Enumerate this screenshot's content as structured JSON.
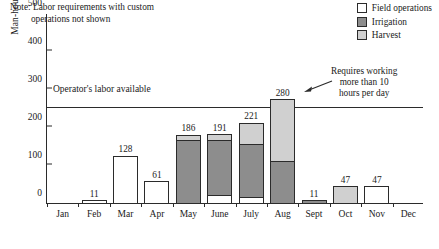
{
  "chart_data": {
    "type": "bar",
    "stacked": true,
    "title": "",
    "xlabel": "",
    "ylabel": "Man-hours required",
    "ylim": [
      0,
      500
    ],
    "yticks": [
      0,
      100,
      200,
      300,
      400,
      500
    ],
    "grid": false,
    "legend_position": "top-right",
    "categories": [
      "Jan",
      "Feb",
      "Mar",
      "Apr",
      "May",
      "June",
      "July",
      "Aug",
      "Sept",
      "Oct",
      "Nov",
      "Dec"
    ],
    "totals": [
      "",
      "11",
      "128",
      "61",
      "186",
      "191",
      "221",
      "280",
      "11",
      "47",
      "47",
      ""
    ],
    "series": [
      {
        "name": "Field operations",
        "color": "#ffffff",
        "values": [
          0,
          11,
          128,
          61,
          0,
          25,
          18,
          0,
          0,
          0,
          47,
          0
        ]
      },
      {
        "name": "Irrigation",
        "color": "#8d8d8d",
        "values": [
          0,
          0,
          0,
          0,
          168,
          148,
          143,
          115,
          11,
          0,
          0,
          0
        ]
      },
      {
        "name": "Harvest",
        "color": "#d0d0d0",
        "values": [
          0,
          0,
          0,
          0,
          18,
          18,
          60,
          165,
          0,
          47,
          0,
          0
        ]
      }
    ],
    "note": "Note: Labor requirements with custom\n         operations not shown",
    "reference_line": {
      "label": "Operator's labor available",
      "value": 250
    },
    "annotation": {
      "text": "Requires working\nmore than 10\nhours per day",
      "target_category": "Aug"
    }
  },
  "legend": {
    "items": [
      {
        "label": "Field operations",
        "color": "#ffffff"
      },
      {
        "label": "Irrigation",
        "color": "#8d8d8d"
      },
      {
        "label": "Harvest",
        "color": "#d0d0d0"
      }
    ]
  }
}
